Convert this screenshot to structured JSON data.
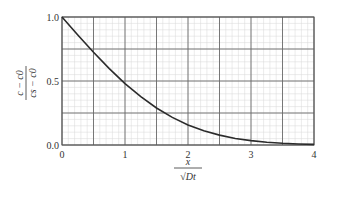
{
  "chart_data": {
    "type": "line",
    "title": "",
    "xlabel": "x / √(Dt)",
    "ylabel": "(c − c0) / (cs − c0)",
    "xlim": [
      0,
      4
    ],
    "ylim": [
      0,
      1
    ],
    "x_ticks": [
      "0",
      "1",
      "2",
      "3",
      "4"
    ],
    "y_ticks": [
      "0.0",
      "0.5",
      "1.0"
    ],
    "grid": true,
    "legend": null,
    "series": [
      {
        "name": "erfc profile",
        "x": [
          0,
          0.25,
          0.5,
          0.75,
          1.0,
          1.25,
          1.5,
          1.75,
          2.0,
          2.25,
          2.5,
          2.75,
          3.0,
          3.25,
          3.5,
          3.75,
          4.0
        ],
        "y": [
          1.0,
          0.859,
          0.724,
          0.597,
          0.48,
          0.377,
          0.289,
          0.216,
          0.157,
          0.111,
          0.077,
          0.051,
          0.034,
          0.022,
          0.013,
          0.008,
          0.005
        ]
      }
    ]
  },
  "labels": {
    "y_num": "c − c0",
    "y_den": "cs − c0",
    "x_num": "x",
    "x_den": "√Dt"
  }
}
